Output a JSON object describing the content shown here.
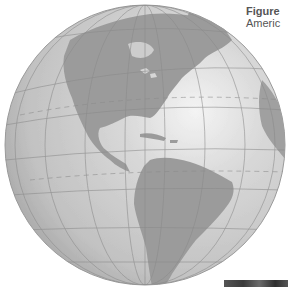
{
  "figure": {
    "caption_label": "Figure",
    "caption_text": "Americ",
    "colors": {
      "ocean_light": "#f2f2f2",
      "ocean_mid": "#cfcfcf",
      "ocean_dark": "#a9a9a9",
      "land": "#9c9c9c",
      "graticule": "#8a8a8a",
      "background": "#ffffff"
    }
  }
}
